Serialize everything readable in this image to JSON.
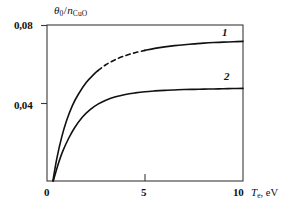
{
  "chart_data": {
    "type": "line",
    "title": "",
    "xlabel": "T_e, eV",
    "ylabel": "θ₀/n_CuO",
    "xlim": [
      0,
      10
    ],
    "ylim": [
      0.0,
      0.08
    ],
    "grid": false,
    "legend": "inline-curve-numbers",
    "x_ticks": [
      {
        "value": 0,
        "label": "0"
      },
      {
        "value": 5,
        "label": "5"
      },
      {
        "value": 10,
        "label": "10"
      }
    ],
    "y_ticks": [
      {
        "value": 0.08,
        "label": "0,08"
      },
      {
        "value": 0.04,
        "label": "0,04"
      }
    ],
    "series": [
      {
        "name": "1",
        "label": "1",
        "color": "#111111",
        "style_note": "solid with dashed segment between x=2.6 and x=5.0",
        "dash_range": [
          2.6,
          5.0
        ],
        "x": [
          0.3,
          0.5,
          0.75,
          1.0,
          1.3,
          1.6,
          2.0,
          2.4,
          2.6,
          3.0,
          3.5,
          4.0,
          4.5,
          5.0,
          5.5,
          6.0,
          6.5,
          7.0,
          7.5,
          8.0,
          8.5,
          9.0,
          9.5,
          10.0
        ],
        "y": [
          0.0,
          0.0115,
          0.0225,
          0.031,
          0.0388,
          0.0445,
          0.0505,
          0.0548,
          0.0566,
          0.0596,
          0.0623,
          0.0643,
          0.0658,
          0.067,
          0.068,
          0.0688,
          0.0694,
          0.0699,
          0.0703,
          0.0707,
          0.071,
          0.0712,
          0.0714,
          0.0716
        ]
      },
      {
        "name": "2",
        "label": "2",
        "color": "#111111",
        "style_note": "solid",
        "dash_range": null,
        "x": [
          0.32,
          0.55,
          0.8,
          1.1,
          1.4,
          1.8,
          2.2,
          2.6,
          3.0,
          3.5,
          4.0,
          4.5,
          5.0,
          5.5,
          6.0,
          6.5,
          7.0,
          7.5,
          8.0,
          8.5,
          9.0,
          9.5,
          10.0
        ],
        "y": [
          0.0,
          0.008,
          0.0152,
          0.0218,
          0.0272,
          0.0327,
          0.0366,
          0.0394,
          0.0414,
          0.0432,
          0.0444,
          0.0452,
          0.0458,
          0.0462,
          0.0465,
          0.0467,
          0.0469,
          0.047,
          0.0471,
          0.0472,
          0.0473,
          0.0474,
          0.0475
        ]
      }
    ]
  },
  "axes": {
    "y_title_main": "θ",
    "y_title_sub": "0",
    "y_title_slash": "/",
    "y_title_n": "n",
    "y_title_n_sub": "CuO",
    "x_title_main": "T",
    "x_title_sub": "e",
    "x_title_unit": ", eV"
  }
}
